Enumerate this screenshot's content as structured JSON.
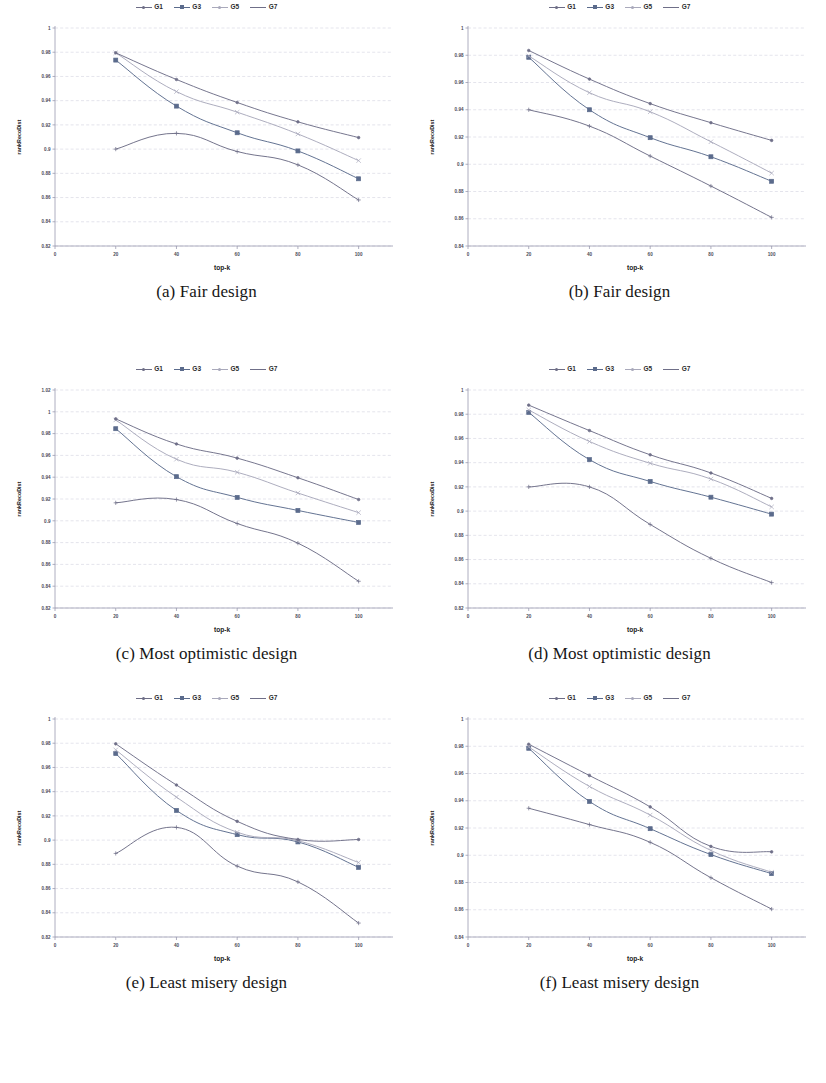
{
  "figure": {
    "legend_series": [
      "G1",
      "G3",
      "G5",
      "G7"
    ],
    "series_colors": [
      "#6d6d86",
      "#5b6b8c",
      "#a9a9bb",
      "#6f6f88"
    ],
    "xlabel": "top-k",
    "ylabel_left": "rankRecoDist",
    "ylabel_right": "rankRecoDist"
  },
  "panels": [
    {
      "id": "a",
      "caption": "(a) Fair design",
      "ylabel": "rankRecoDist"
    },
    {
      "id": "b",
      "caption": "(b) Fair design",
      "ylabel": "rankRecoDist"
    },
    {
      "id": "c",
      "caption": "(c) Most optimistic design",
      "ylabel": "rankRecoDist"
    },
    {
      "id": "d",
      "caption": "(d) Most optimistic design",
      "ylabel": "rankRecoDist"
    },
    {
      "id": "e",
      "caption": "(e) Least misery design",
      "ylabel": "rankRecoDist"
    },
    {
      "id": "f",
      "caption": "(f) Least misery design",
      "ylabel": "rankRecoDist"
    }
  ],
  "chart_data": [
    {
      "panel": "a",
      "type": "line",
      "title": "(a) Fair design",
      "xlabel": "top-k",
      "ylabel": "rankRecoDist",
      "x": [
        20,
        40,
        60,
        80,
        100
      ],
      "xticks": [
        0,
        20,
        40,
        60,
        80,
        100
      ],
      "xlim": [
        0,
        110
      ],
      "yticks": [
        1,
        0.98,
        0.96,
        0.94,
        0.92,
        0.9,
        0.88,
        0.86,
        0.84,
        0.82
      ],
      "ylim": [
        0.82,
        1.0
      ],
      "grid": true,
      "legend": "top-center",
      "series": [
        {
          "name": "G1",
          "values": [
            0.9,
            0.913,
            0.898,
            0.887,
            0.858
          ]
        },
        {
          "name": "G3",
          "values": [
            0.9735,
            0.9355,
            0.9135,
            0.8985,
            0.8755
          ]
        },
        {
          "name": "G5",
          "values": [
            0.9795,
            0.9475,
            0.9305,
            0.9125,
            0.8905
          ]
        },
        {
          "name": "G7",
          "values": [
            0.9795,
            0.9575,
            0.9385,
            0.9225,
            0.9095
          ]
        }
      ]
    },
    {
      "panel": "b",
      "type": "line",
      "title": "(b) Fair design",
      "xlabel": "top-k",
      "ylabel": "rankRecoDist",
      "x": [
        20,
        40,
        60,
        80,
        100
      ],
      "xticks": [
        0,
        20,
        40,
        60,
        80,
        100
      ],
      "xlim": [
        0,
        110
      ],
      "yticks": [
        1,
        0.98,
        0.96,
        0.94,
        0.92,
        0.9,
        0.88,
        0.86,
        0.84
      ],
      "ylim": [
        0.84,
        1.0
      ],
      "grid": true,
      "legend": "top-center",
      "series": [
        {
          "name": "G1",
          "values": [
            0.94,
            0.928,
            0.906,
            0.884,
            0.861
          ]
        },
        {
          "name": "G3",
          "values": [
            0.9785,
            0.94,
            0.9195,
            0.9055,
            0.8875
          ]
        },
        {
          "name": "G5",
          "values": [
            0.9795,
            0.9525,
            0.9385,
            0.9165,
            0.8935
          ]
        },
        {
          "name": "G7",
          "values": [
            0.9835,
            0.9625,
            0.9445,
            0.9305,
            0.9175
          ]
        }
      ]
    },
    {
      "panel": "c",
      "type": "line",
      "title": "(c) Most optimistic design",
      "xlabel": "top-k",
      "ylabel": "rankRecoDist",
      "x": [
        20,
        40,
        60,
        80,
        100
      ],
      "xticks": [
        0,
        20,
        40,
        60,
        80,
        100
      ],
      "xlim": [
        0,
        110
      ],
      "yticks": [
        1.02,
        1,
        0.98,
        0.96,
        0.94,
        0.92,
        0.9,
        0.88,
        0.86,
        0.84,
        0.82
      ],
      "ylim": [
        0.82,
        1.02
      ],
      "grid": true,
      "legend": "top-center",
      "series": [
        {
          "name": "G1",
          "values": [
            0.9165,
            0.9195,
            0.8975,
            0.8795,
            0.8445
          ]
        },
        {
          "name": "G3",
          "values": [
            0.9845,
            0.9405,
            0.9215,
            0.9095,
            0.8985
          ]
        },
        {
          "name": "G5",
          "values": [
            0.9925,
            0.9565,
            0.9445,
            0.9255,
            0.9075
          ]
        },
        {
          "name": "G7",
          "values": [
            0.9935,
            0.9705,
            0.9575,
            0.9395,
            0.9195
          ]
        }
      ]
    },
    {
      "panel": "d",
      "type": "line",
      "title": "(d) Most optimistic design",
      "xlabel": "top-k",
      "ylabel": "rankRecoDist",
      "x": [
        20,
        40,
        60,
        80,
        100
      ],
      "xticks": [
        0,
        20,
        40,
        60,
        80,
        100
      ],
      "xlim": [
        0,
        110
      ],
      "yticks": [
        1,
        0.98,
        0.96,
        0.94,
        0.92,
        0.9,
        0.88,
        0.86,
        0.84,
        0.82
      ],
      "ylim": [
        0.82,
        1.0
      ],
      "grid": true,
      "legend": "top-center",
      "series": [
        {
          "name": "G1",
          "values": [
            0.92,
            0.92,
            0.889,
            0.861,
            0.841
          ]
        },
        {
          "name": "G3",
          "values": [
            0.9815,
            0.9425,
            0.9245,
            0.9115,
            0.8975
          ]
        },
        {
          "name": "G5",
          "values": [
            0.9835,
            0.9575,
            0.9395,
            0.9265,
            0.9035
          ]
        },
        {
          "name": "G7",
          "values": [
            0.9875,
            0.9665,
            0.9465,
            0.9315,
            0.9105
          ]
        }
      ]
    },
    {
      "panel": "e",
      "type": "line",
      "title": "(e) Least misery design",
      "xlabel": "top-k",
      "ylabel": "rankRecoDist",
      "x": [
        20,
        40,
        60,
        80,
        100
      ],
      "xticks": [
        0,
        20,
        40,
        60,
        80,
        100
      ],
      "xlim": [
        0,
        110
      ],
      "yticks": [
        1,
        0.98,
        0.96,
        0.94,
        0.92,
        0.9,
        0.88,
        0.86,
        0.84,
        0.82
      ],
      "ylim": [
        0.82,
        1.0
      ],
      "grid": true,
      "legend": "top-center",
      "series": [
        {
          "name": "G1",
          "values": [
            0.889,
            0.9105,
            0.8785,
            0.8655,
            0.8315
          ]
        },
        {
          "name": "G3",
          "values": [
            0.9715,
            0.9245,
            0.9045,
            0.8985,
            0.8775
          ]
        },
        {
          "name": "G5",
          "values": [
            0.9745,
            0.9355,
            0.9065,
            0.8995,
            0.8815
          ]
        },
        {
          "name": "G7",
          "values": [
            0.9795,
            0.9455,
            0.9155,
            0.9005,
            0.9005
          ]
        }
      ]
    },
    {
      "panel": "f",
      "type": "line",
      "title": "(f) Least misery design",
      "xlabel": "top-k",
      "ylabel": "rankRecoDist",
      "x": [
        20,
        40,
        60,
        80,
        100
      ],
      "xticks": [
        0,
        20,
        40,
        60,
        80,
        100
      ],
      "xlim": [
        0,
        110
      ],
      "yticks": [
        1,
        0.98,
        0.96,
        0.94,
        0.92,
        0.9,
        0.88,
        0.86,
        0.84
      ],
      "ylim": [
        0.84,
        1.0
      ],
      "grid": true,
      "legend": "top-center",
      "series": [
        {
          "name": "G1",
          "values": [
            0.9345,
            0.9225,
            0.9095,
            0.8835,
            0.8605
          ]
        },
        {
          "name": "G3",
          "values": [
            0.9785,
            0.9395,
            0.9195,
            0.9005,
            0.8865
          ]
        },
        {
          "name": "G5",
          "values": [
            0.9795,
            0.9505,
            0.9295,
            0.9035,
            0.8875
          ]
        },
        {
          "name": "G7",
          "values": [
            0.9815,
            0.9585,
            0.9355,
            0.9065,
            0.9025
          ]
        }
      ]
    }
  ]
}
